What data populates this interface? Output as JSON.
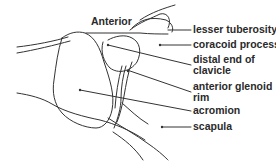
{
  "diagram": {
    "orientation_label": "Anterior",
    "labels": [
      {
        "id": "lesser-tuberosity",
        "lines": [
          "lesser tuberosity"
        ]
      },
      {
        "id": "coracoid-process",
        "lines": [
          "coracoid process"
        ]
      },
      {
        "id": "distal-end-of-clavicle",
        "lines": [
          "distal end of",
          "clavicle"
        ]
      },
      {
        "id": "anterior-glenoid-rim",
        "lines": [
          "anterior glenoid",
          "rim"
        ]
      },
      {
        "id": "acromion",
        "lines": [
          "acromion"
        ]
      },
      {
        "id": "scapula",
        "lines": [
          "scapula"
        ]
      }
    ],
    "colors": {
      "stroke": "#333333",
      "text": "#2a2a2a",
      "background": "#ffffff"
    }
  }
}
